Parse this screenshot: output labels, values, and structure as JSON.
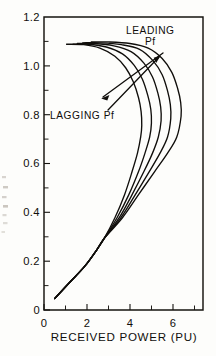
{
  "figure": {
    "background_color": "#fdfdfb",
    "ink_color": "#100e0b"
  },
  "chart_data": {
    "type": "line",
    "title": "",
    "xlabel": "RECEIVED POWER (PU)",
    "ylabel": "",
    "xlim": [
      0,
      7.4
    ],
    "ylim": [
      0,
      1.27
    ],
    "grid": false,
    "legend_position": "none",
    "x_tick_labels": [
      "0",
      "2",
      "4",
      "6"
    ],
    "x_tick_values": [
      0,
      2,
      4,
      6
    ],
    "x_minor_tick_values": [
      1,
      3,
      5,
      7
    ],
    "y_tick_labels": [
      "0",
      "0.2",
      "0.4",
      "0.6",
      "0.8",
      "1.0",
      "1.2"
    ],
    "y_tick_values": [
      0,
      0.2,
      0.4,
      0.6,
      0.8,
      1.0,
      1.2
    ],
    "y_minor_tick_values": [
      0.1,
      0.3,
      0.5,
      0.7,
      0.9,
      1.1
    ],
    "annotations": [
      {
        "name": "leading-pf",
        "line1": "LEADING",
        "line2": "Pf",
        "points_to": "innermost-curves"
      },
      {
        "name": "lagging-pf",
        "line1": "LAGGING Pf",
        "line2": "",
        "points_to": "outermost-curves"
      }
    ],
    "series": [
      {
        "name": "curve-1",
        "power_factor": "most lagging",
        "nose_point": [
          4.55,
          0.8
        ],
        "points": [
          [
            0.5,
            0.05
          ],
          [
            1.2,
            0.12
          ],
          [
            1.9,
            0.19
          ],
          [
            2.45,
            0.26
          ],
          [
            2.8,
            0.31
          ],
          [
            3.3,
            0.4
          ],
          [
            3.75,
            0.5
          ],
          [
            4.1,
            0.6
          ],
          [
            4.35,
            0.68
          ],
          [
            4.5,
            0.75
          ],
          [
            4.55,
            0.8
          ],
          [
            4.52,
            0.86
          ],
          [
            4.4,
            0.92
          ],
          [
            4.15,
            0.99
          ],
          [
            3.8,
            1.05
          ],
          [
            3.3,
            1.1
          ],
          [
            2.6,
            1.135
          ],
          [
            1.85,
            1.15
          ],
          [
            1.05,
            1.152
          ]
        ]
      },
      {
        "name": "curve-2",
        "power_factor": "lagging",
        "nose_point": [
          5.0,
          0.8
        ],
        "points": [
          [
            0.5,
            0.05
          ],
          [
            1.2,
            0.12
          ],
          [
            1.9,
            0.19
          ],
          [
            2.45,
            0.26
          ],
          [
            2.8,
            0.31
          ],
          [
            3.4,
            0.4
          ],
          [
            3.95,
            0.5
          ],
          [
            4.4,
            0.6
          ],
          [
            4.7,
            0.68
          ],
          [
            4.92,
            0.75
          ],
          [
            5.0,
            0.81
          ],
          [
            4.97,
            0.87
          ],
          [
            4.83,
            0.93
          ],
          [
            4.58,
            1.0
          ],
          [
            4.2,
            1.06
          ],
          [
            3.65,
            1.11
          ],
          [
            2.9,
            1.14
          ],
          [
            2.05,
            1.152
          ],
          [
            1.35,
            1.152
          ]
        ]
      },
      {
        "name": "curve-3",
        "power_factor": "unity",
        "nose_point": [
          5.45,
          0.81
        ],
        "points": [
          [
            0.5,
            0.05
          ],
          [
            1.2,
            0.12
          ],
          [
            1.9,
            0.19
          ],
          [
            2.45,
            0.26
          ],
          [
            2.8,
            0.31
          ],
          [
            3.5,
            0.4
          ],
          [
            4.1,
            0.5
          ],
          [
            4.65,
            0.6
          ],
          [
            5.05,
            0.68
          ],
          [
            5.32,
            0.75
          ],
          [
            5.45,
            0.82
          ],
          [
            5.43,
            0.88
          ],
          [
            5.3,
            0.94
          ],
          [
            5.05,
            1.01
          ],
          [
            4.65,
            1.07
          ],
          [
            4.05,
            1.12
          ],
          [
            3.25,
            1.145
          ],
          [
            2.35,
            1.155
          ],
          [
            1.55,
            1.155
          ]
        ]
      },
      {
        "name": "curve-4",
        "power_factor": "leading",
        "nose_point": [
          5.9,
          0.82
        ],
        "points": [
          [
            0.5,
            0.05
          ],
          [
            1.2,
            0.12
          ],
          [
            1.9,
            0.19
          ],
          [
            2.45,
            0.26
          ],
          [
            2.8,
            0.31
          ],
          [
            3.58,
            0.4
          ],
          [
            4.25,
            0.5
          ],
          [
            4.9,
            0.6
          ],
          [
            5.4,
            0.68
          ],
          [
            5.75,
            0.75
          ],
          [
            5.9,
            0.83
          ],
          [
            5.88,
            0.89
          ],
          [
            5.75,
            0.95
          ],
          [
            5.5,
            1.02
          ],
          [
            5.08,
            1.08
          ],
          [
            4.45,
            1.13
          ],
          [
            3.6,
            1.15
          ],
          [
            2.65,
            1.158
          ],
          [
            1.8,
            1.158
          ]
        ]
      },
      {
        "name": "curve-5",
        "power_factor": "most leading",
        "nose_point": [
          6.38,
          0.83
        ],
        "points": [
          [
            0.5,
            0.05
          ],
          [
            1.2,
            0.12
          ],
          [
            1.9,
            0.19
          ],
          [
            2.45,
            0.26
          ],
          [
            2.8,
            0.31
          ],
          [
            3.65,
            0.4
          ],
          [
            4.4,
            0.5
          ],
          [
            5.15,
            0.6
          ],
          [
            5.75,
            0.68
          ],
          [
            6.18,
            0.75
          ],
          [
            6.38,
            0.84
          ],
          [
            6.36,
            0.9
          ],
          [
            6.22,
            0.96
          ],
          [
            5.95,
            1.03
          ],
          [
            5.5,
            1.09
          ],
          [
            4.85,
            1.135
          ],
          [
            4.0,
            1.155
          ],
          [
            3.0,
            1.162
          ],
          [
            2.2,
            1.162
          ]
        ]
      }
    ]
  }
}
